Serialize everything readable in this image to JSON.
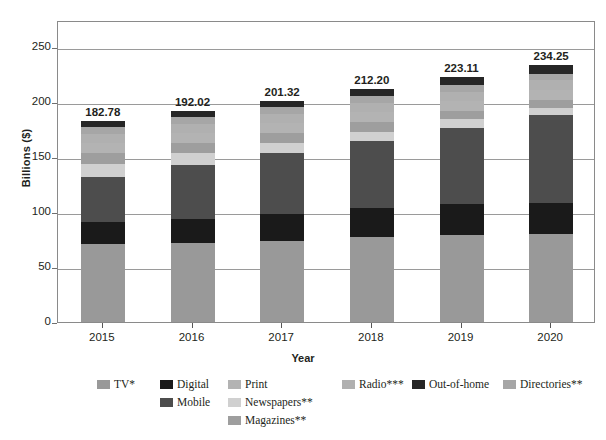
{
  "chart_data": {
    "type": "bar",
    "stacked": true,
    "title": "",
    "xlabel": "Year",
    "ylabel": "Billions ($)",
    "categories": [
      "2015",
      "2016",
      "2017",
      "2018",
      "2019",
      "2020"
    ],
    "ylim": [
      0,
      275
    ],
    "yticks": [
      0,
      50,
      100,
      150,
      200,
      250
    ],
    "ytick_labels": [
      "0",
      "50",
      "100",
      "150",
      "200",
      "250"
    ],
    "grid": true,
    "legend_position": "bottom",
    "totals": [
      "182.78",
      "192.02",
      "201.32",
      "212.20",
      "223.11",
      "234.25"
    ],
    "total_values": [
      182.78,
      192.02,
      201.32,
      212.2,
      223.11,
      234.25
    ],
    "series": [
      {
        "name": "TV*",
        "color": "#999999",
        "values": [
          71.0,
          71.5,
          74.0,
          77.0,
          79.0,
          80.5
        ]
      },
      {
        "name": "Digital",
        "color": "#1a1a1a",
        "values": [
          20.5,
          22.0,
          24.5,
          26.5,
          28.5,
          28.0
        ]
      },
      {
        "name": "Mobile",
        "color": "#4d4d4d",
        "values": [
          41.0,
          49.5,
          55.5,
          61.5,
          69.5,
          80.0
        ]
      },
      {
        "name": "Newspapers**",
        "color": "#d0d0d0",
        "values": [
          11.5,
          10.5,
          9.5,
          8.5,
          7.5,
          6.5
        ]
      },
      {
        "name": "Magazines**",
        "color": "#9e9e9e",
        "values": [
          10.0,
          9.5,
          9.0,
          8.5,
          8.0,
          7.5
        ]
      },
      {
        "name": "Print",
        "color": "#b3b3b3",
        "values": [
          9.0,
          9.0,
          9.0,
          9.0,
          9.0,
          9.0
        ]
      },
      {
        "name": "Radio***",
        "color": "#b0b0b0",
        "values": [
          8.0,
          8.0,
          8.0,
          8.2,
          8.3,
          8.5
        ]
      },
      {
        "name": "Directories**",
        "color": "#a6a6a6",
        "values": [
          7.0,
          6.5,
          6.3,
          6.3,
          6.3,
          6.25
        ]
      },
      {
        "name": "Out-of-home",
        "color": "#262626",
        "values": [
          4.78,
          5.52,
          5.52,
          6.7,
          7.01,
          8.0
        ]
      }
    ]
  },
  "legend": {
    "row1": [
      {
        "label": "TV*",
        "color": "#999999",
        "left": 97,
        "name": "legend-item-tv"
      },
      {
        "label": "Digital",
        "color": "#1a1a1a",
        "left": 160,
        "name": "legend-item-digital"
      },
      {
        "label": "Print",
        "color": "#b3b3b3",
        "left": 228,
        "name": "legend-item-print"
      },
      {
        "label": "Radio***",
        "color": "#b0b0b0",
        "left": 342,
        "name": "legend-item-radio"
      },
      {
        "label": "Out-of-home",
        "color": "#262626",
        "left": 412,
        "name": "legend-item-out-of-home"
      },
      {
        "label": "Directories**",
        "color": "#a6a6a6",
        "left": 503,
        "name": "legend-item-directories"
      }
    ],
    "row2": [
      {
        "label": "Mobile",
        "color": "#4d4d4d",
        "left": 160,
        "name": "legend-item-mobile"
      },
      {
        "label": "Newspapers**",
        "color": "#d0d0d0",
        "left": 228,
        "name": "legend-item-newspapers"
      }
    ],
    "row3": [
      {
        "label": "Magazines**",
        "color": "#9e9e9e",
        "left": 228,
        "name": "legend-item-magazines"
      }
    ]
  }
}
